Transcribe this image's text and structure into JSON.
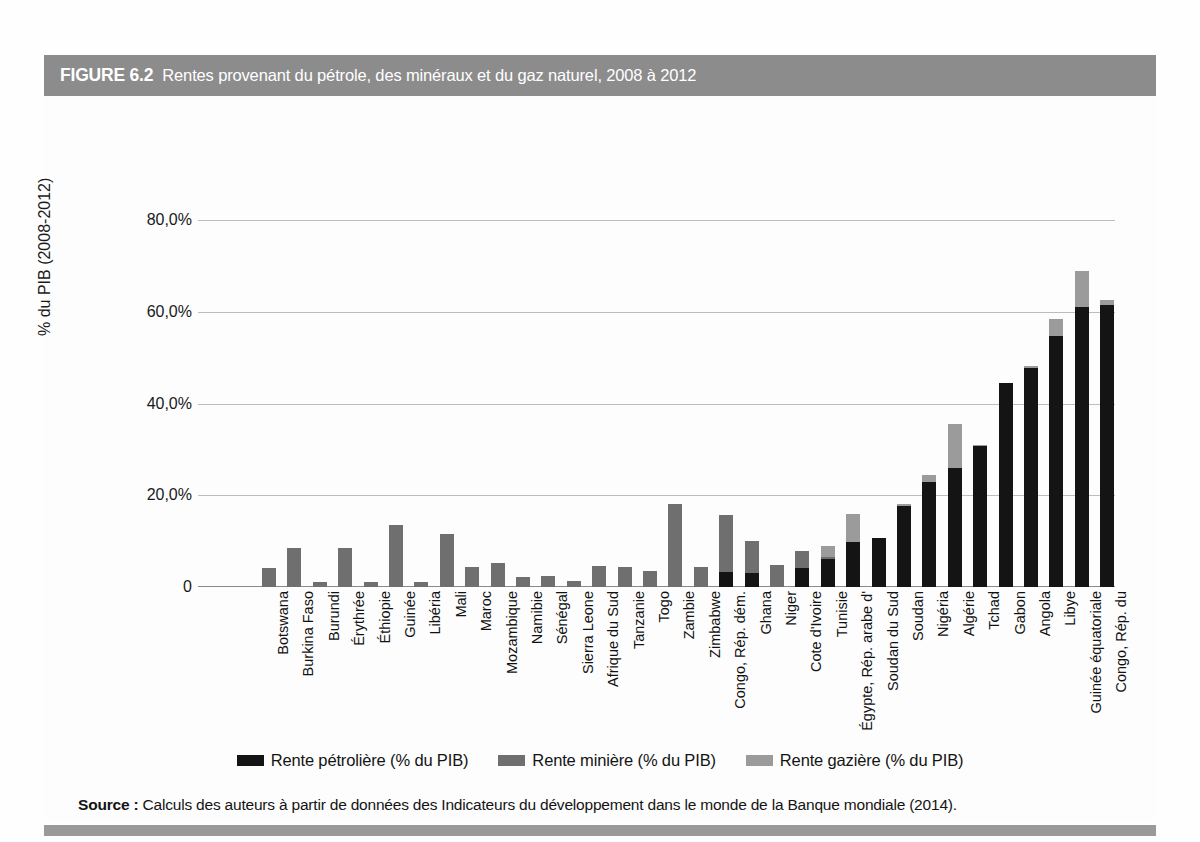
{
  "figure": {
    "number_label": "FIGURE 6.2",
    "title": "Rentes provenant du pétrole, des minéraux et du gaz naturel, 2008 à 2012"
  },
  "source": {
    "label": "Source :",
    "text": " Calculs des auteurs à partir de données des Indicateurs du développement dans le monde de la Banque mondiale (2014)."
  },
  "legend": {
    "items": [
      {
        "label": "Rente pétrolière (% du PIB)",
        "color": "#141414",
        "key": "oil"
      },
      {
        "label": "Rente minière (% du PIB)",
        "color": "#6f6f6f",
        "key": "mineral"
      },
      {
        "label": "Rente gazière (% du PIB)",
        "color": "#9b9b9b",
        "key": "gas"
      }
    ]
  },
  "chart_data": {
    "type": "bar",
    "subtype": "stacked-vertical",
    "title": "Rentes provenant du pétrole, des minéraux et du gaz naturel, 2008 à 2012",
    "xlabel": "",
    "ylabel": "% du PIB (2008-2012)",
    "ylim": [
      0,
      80
    ],
    "ytick_values": [
      0,
      20,
      40,
      60,
      80
    ],
    "ytick_labels": [
      "0",
      "20,0%",
      "40,0%",
      "60,0%",
      "80,0%"
    ],
    "grid": "horizontal",
    "legend_position": "bottom-center",
    "series": [
      {
        "name": "Rente pétrolière (% du PIB)",
        "key": "oil",
        "color": "#141414"
      },
      {
        "name": "Rente minière (% du PIB)",
        "key": "mineral",
        "color": "#6f6f6f"
      },
      {
        "name": "Rente gazière (% du PIB)",
        "key": "gas",
        "color": "#9b9b9b"
      }
    ],
    "categories": [
      "Botswana",
      "Burkina Faso",
      "Burundi",
      "Érythrée",
      "Éthiopie",
      "Guinée",
      "Libéria",
      "Mali",
      "Maroc",
      "Mozambique",
      "Namibie",
      "Sénégal",
      "Sierra Leone",
      "Afrique du Sud",
      "Tanzanie",
      "Togo",
      "Zambie",
      "Zimbabwe",
      "Congo, Rép. dém.",
      "Ghana",
      "Niger",
      "Cote d'Ivoire",
      "Tunisie",
      "Égypte, Rép. arabe d'",
      "Soudan du Sud",
      "Soudan",
      "Nigéria",
      "Algérie",
      "Tchad",
      "Gabon",
      "Angola",
      "Libye",
      "Guinée équatoriale",
      "Congo, Rép. du"
    ],
    "values": {
      "oil": [
        0.0,
        0.0,
        0.0,
        0.0,
        0.0,
        0.0,
        0.0,
        0.0,
        0.0,
        0.0,
        0.0,
        0.0,
        0.0,
        0.0,
        0.0,
        0.0,
        0.0,
        0.0,
        3.2,
        3.0,
        0.0,
        4.2,
        6.0,
        9.8,
        10.7,
        17.6,
        23.0,
        26.0,
        30.7,
        44.5,
        47.8,
        54.8,
        61.0,
        61.5
      ],
      "mineral": [
        4.1,
        8.6,
        1.2,
        8.6,
        1.2,
        13.6,
        1.2,
        11.6,
        4.4,
        5.3,
        2.2,
        2.3,
        1.3,
        4.5,
        4.4,
        3.4,
        18.0,
        4.4,
        12.6,
        7.0,
        4.7,
        3.6,
        0.6,
        0.0,
        0.0,
        0.0,
        0.0,
        0.0,
        0.0,
        0.0,
        0.0,
        0.0,
        0.0,
        0.0
      ],
      "gas": [
        0.0,
        0.0,
        0.0,
        0.0,
        0.0,
        0.0,
        0.0,
        0.0,
        0.0,
        0.0,
        0.0,
        0.0,
        0.0,
        0.0,
        0.0,
        0.0,
        0.0,
        0.0,
        0.0,
        0.0,
        0.0,
        0.0,
        2.4,
        6.2,
        0.0,
        0.4,
        1.5,
        9.6,
        0.3,
        0.0,
        0.3,
        3.7,
        7.8,
        1.1
      ]
    },
    "totals": [
      4.1,
      8.6,
      1.2,
      8.6,
      1.2,
      13.6,
      1.2,
      11.6,
      4.4,
      5.3,
      2.2,
      2.3,
      1.3,
      4.5,
      4.4,
      3.4,
      18.0,
      4.4,
      15.8,
      10.0,
      4.7,
      7.8,
      9.0,
      16.0,
      10.7,
      18.0,
      24.5,
      35.6,
      31.0,
      44.5,
      48.1,
      58.5,
      68.8,
      62.6
    ]
  }
}
